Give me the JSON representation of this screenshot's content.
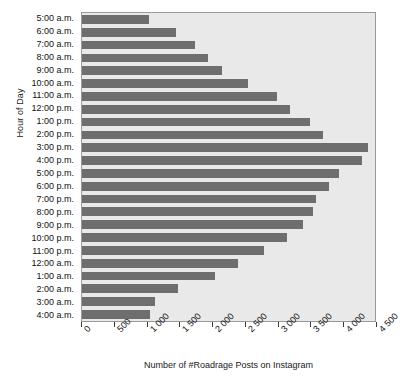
{
  "chart_data": {
    "type": "bar",
    "orientation": "horizontal",
    "title": "",
    "xlabel": "Number of #Roadrage Posts on Instagram",
    "ylabel": "Hour of Day",
    "xlim": [
      0,
      4500
    ],
    "xticks": [
      0,
      500,
      1000,
      1500,
      2000,
      2500,
      3000,
      3500,
      4000,
      4500
    ],
    "xtick_labels": [
      "0",
      "500",
      "1 000",
      "1 500",
      "2 000",
      "2 500",
      "3 000",
      "3 500",
      "4 000",
      "4 500"
    ],
    "grid": false,
    "legend": "none",
    "bar_color": "#6e6e6e",
    "plot_background": "#e9e9e9",
    "categories": [
      "5:00 a.m.",
      "6:00 a.m.",
      "7:00 a.m.",
      "8:00 a.m.",
      "9:00 a.m.",
      "10:00 a.m.",
      "11:00 a.m.",
      "12:00 p.m.",
      "1:00 p.m.",
      "2:00 p.m.",
      "3:00 p.m.",
      "4:00 p.m.",
      "5:00 p.m.",
      "6:00 p.m.",
      "7:00 p.m.",
      "8:00 p.m.",
      "9:00 p.m.",
      "10:00 p.m.",
      "11:00 p.m.",
      "12:00 a.m.",
      "1:00 a.m.",
      "2:00 a.m.",
      "3:00 a.m.",
      "4:00 a.m."
    ],
    "values": [
      1030,
      1450,
      1730,
      1940,
      2150,
      2550,
      3000,
      3200,
      3500,
      3700,
      4400,
      4300,
      3950,
      3800,
      3600,
      3550,
      3400,
      3150,
      2800,
      2400,
      2050,
      1480,
      1120,
      1050
    ]
  }
}
